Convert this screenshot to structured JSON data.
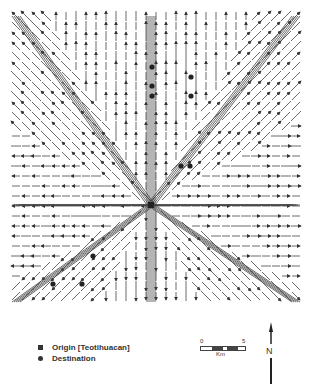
{
  "figure": {
    "type": "flow-network-map"
  },
  "origin": {
    "label": "Origin [Teotihuacan]",
    "x": 151,
    "y": 205
  },
  "destinations": [
    {
      "x": 152,
      "y": 67
    },
    {
      "x": 152,
      "y": 86
    },
    {
      "x": 152,
      "y": 96
    },
    {
      "x": 191,
      "y": 77
    },
    {
      "x": 191,
      "y": 96
    },
    {
      "x": 181,
      "y": 166
    },
    {
      "x": 190,
      "y": 166
    },
    {
      "x": 93,
      "y": 256
    },
    {
      "x": 53,
      "y": 284
    },
    {
      "x": 82,
      "y": 284
    }
  ],
  "grid": {
    "x0": 16,
    "y0": 16,
    "x1": 296,
    "y1": 302,
    "step": 10
  },
  "legend": {
    "origin_label": "Origin [Teotihuacan]",
    "destination_label": "Destination"
  },
  "scale_bar": {
    "start": "0",
    "end": "5",
    "unit": "Km"
  },
  "north_arrow": {
    "label": "N"
  },
  "colors": {
    "ink": "#333333",
    "background": "#ffffff"
  }
}
